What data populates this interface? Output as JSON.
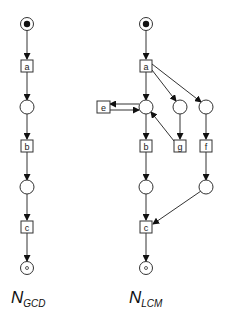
{
  "nets": [
    {
      "name": "N",
      "subscript": "GCD",
      "transitions": [
        {
          "id": "a",
          "label": "a",
          "x": 27,
          "y": 66
        },
        {
          "id": "b",
          "label": "b",
          "x": 27,
          "y": 146
        },
        {
          "id": "c",
          "label": "c",
          "x": 27,
          "y": 227
        }
      ],
      "places": [
        {
          "id": "start",
          "x": 27,
          "y": 24,
          "token": "filled"
        },
        {
          "id": "p1",
          "x": 27,
          "y": 107
        },
        {
          "id": "p2",
          "x": 27,
          "y": 187
        },
        {
          "id": "end",
          "x": 27,
          "y": 268,
          "token": "small"
        }
      ]
    },
    {
      "name": "N",
      "subscript": "LCM",
      "transitions": [
        {
          "id": "a",
          "label": "a",
          "x": 146,
          "y": 66
        },
        {
          "id": "e",
          "label": "e",
          "x": 103,
          "y": 107
        },
        {
          "id": "b",
          "label": "b",
          "x": 146,
          "y": 146
        },
        {
          "id": "g",
          "label": "g",
          "x": 180,
          "y": 146
        },
        {
          "id": "f",
          "label": "f",
          "x": 206,
          "y": 146
        },
        {
          "id": "c",
          "label": "c",
          "x": 146,
          "y": 227
        }
      ],
      "places": [
        {
          "id": "start",
          "x": 146,
          "y": 24,
          "token": "filled"
        },
        {
          "id": "p1",
          "x": 146,
          "y": 107
        },
        {
          "id": "pg",
          "x": 180,
          "y": 107
        },
        {
          "id": "pf",
          "x": 206,
          "y": 107
        },
        {
          "id": "p2",
          "x": 146,
          "y": 187
        },
        {
          "id": "pf2",
          "x": 206,
          "y": 187
        },
        {
          "id": "end",
          "x": 146,
          "y": 268,
          "token": "small"
        }
      ]
    }
  ],
  "labels": {
    "gcd_main": "N",
    "gcd_sub": "GCD",
    "lcm_main": "N",
    "lcm_sub": "LCM",
    "t_a1": "a",
    "t_b1": "b",
    "t_c1": "c",
    "t_a2": "a",
    "t_e": "e",
    "t_b2": "b",
    "t_g": "g",
    "t_f": "f",
    "t_c2": "c"
  }
}
